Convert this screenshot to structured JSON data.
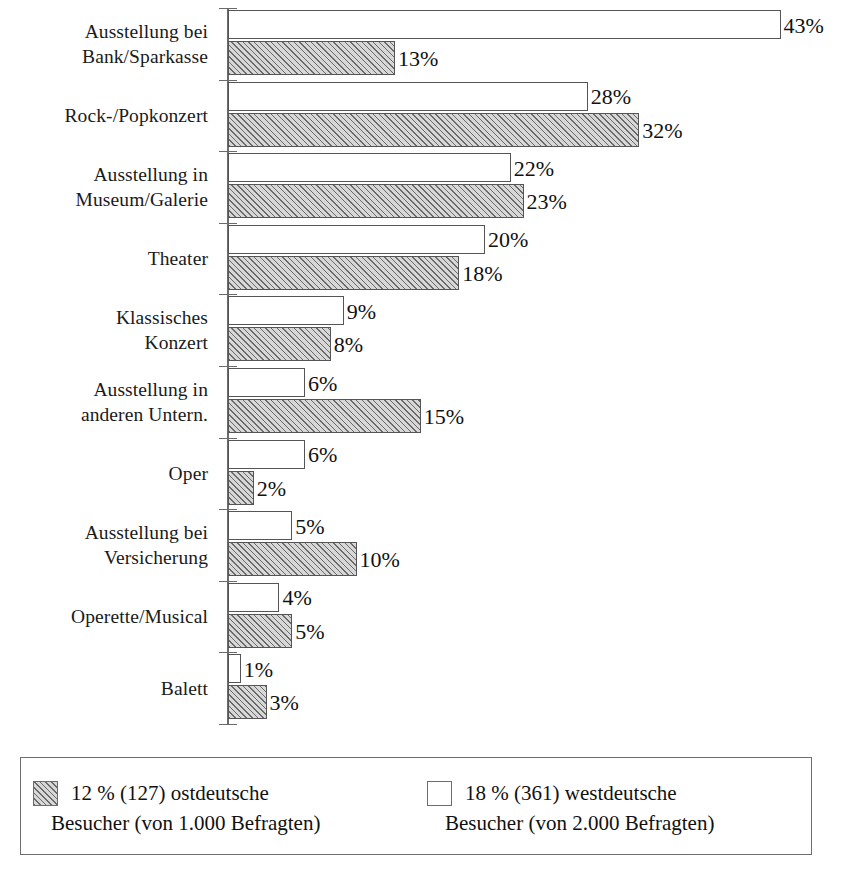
{
  "chart_data": {
    "type": "bar",
    "orientation": "horizontal",
    "title": "",
    "subtitle": "",
    "xlabel": "",
    "ylabel": "",
    "xlim": [
      0,
      43
    ],
    "grid": false,
    "legend_position": "bottom",
    "value_suffix": "%",
    "categories": [
      "Ausstellung bei Bank/Sparkasse",
      "Rock-/Popkonzert",
      "Ausstellung in Museum/Galerie",
      "Theater",
      "Klassisches Konzert",
      "Ausstellung in anderen Untern.",
      "Oper",
      "Ausstellung bei Versicherung",
      "Operette/Musical",
      "Balett"
    ],
    "category_lines": [
      [
        "Ausstellung bei",
        "Bank/Sparkasse"
      ],
      [
        "Rock-/Popkonzert"
      ],
      [
        "Ausstellung in",
        "Museum/Galerie"
      ],
      [
        "Theater"
      ],
      [
        "Klassisches",
        "Konzert"
      ],
      [
        "Ausstellung in",
        "anderen Untern."
      ],
      [
        "Oper"
      ],
      [
        "Ausstellung bei",
        "Versicherung"
      ],
      [
        "Operette/Musical"
      ],
      [
        "Balett"
      ]
    ],
    "series": [
      {
        "name": "westdeutsche Besucher",
        "key": "west",
        "style": "white",
        "values": [
          43,
          28,
          22,
          20,
          9,
          6,
          6,
          5,
          4,
          1
        ],
        "labels": [
          "43%",
          "28%",
          "22%",
          "20%",
          "9%",
          "6%",
          "6%",
          "5%",
          "4%",
          "1%"
        ]
      },
      {
        "name": "ostdeutsche Besucher",
        "key": "east",
        "style": "hatched",
        "values": [
          13,
          32,
          23,
          18,
          8,
          15,
          2,
          10,
          5,
          3
        ],
        "labels": [
          "13%",
          "32%",
          "23%",
          "18%",
          "8%",
          "15%",
          "2%",
          "10%",
          "5%",
          "3%"
        ]
      }
    ]
  },
  "legend": {
    "entries": [
      {
        "swatch": "hatched-swatch",
        "line1": "12 % (127) ostdeutsche",
        "line2": "Besucher (von 1.000 Befragten)"
      },
      {
        "swatch": "white-swatch",
        "line1": "18 % (361) westdeutsche",
        "line2": "Besucher (von 2.000 Befragten)"
      }
    ]
  }
}
